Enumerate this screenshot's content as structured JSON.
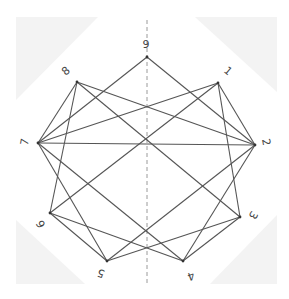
{
  "diagram": {
    "type": "graph",
    "nodes": [
      {
        "id": "1",
        "label": "1",
        "x": 218,
        "y": 83,
        "lx": 228,
        "ly": 71,
        "rot": 40
      },
      {
        "id": "2",
        "label": "2",
        "x": 255,
        "y": 145,
        "lx": 266,
        "ly": 142,
        "rot": 80
      },
      {
        "id": "3",
        "label": "3",
        "x": 240,
        "y": 217,
        "lx": 253,
        "ly": 215,
        "rot": 120
      },
      {
        "id": "4",
        "label": "4",
        "x": 183,
        "y": 261,
        "lx": 191,
        "ly": 276,
        "rot": 160
      },
      {
        "id": "5",
        "label": "5",
        "x": 107,
        "y": 261,
        "lx": 101,
        "ly": 273,
        "rot": 200
      },
      {
        "id": "6",
        "label": "6",
        "x": 50,
        "y": 213,
        "lx": 41,
        "ly": 224,
        "rot": 240
      },
      {
        "id": "7",
        "label": "7",
        "x": 38,
        "y": 143,
        "lx": 25,
        "ly": 142,
        "rot": 280
      },
      {
        "id": "8",
        "label": "8",
        "x": 77,
        "y": 82,
        "lx": 66,
        "ly": 71,
        "rot": 320
      },
      {
        "id": "9",
        "label": "9",
        "x": 147,
        "y": 57,
        "lx": 146,
        "ly": 44,
        "rot": 0
      }
    ],
    "edges": [
      [
        "9",
        "7"
      ],
      [
        "9",
        "2"
      ],
      [
        "8",
        "7"
      ],
      [
        "8",
        "6"
      ],
      [
        "8",
        "2"
      ],
      [
        "8",
        "3"
      ],
      [
        "1",
        "7"
      ],
      [
        "1",
        "6"
      ],
      [
        "1",
        "2"
      ],
      [
        "1",
        "3"
      ],
      [
        "7",
        "2"
      ],
      [
        "7",
        "5"
      ],
      [
        "7",
        "4"
      ],
      [
        "6",
        "5"
      ],
      [
        "6",
        "4"
      ],
      [
        "5",
        "2"
      ],
      [
        "5",
        "3"
      ],
      [
        "4",
        "2"
      ],
      [
        "4",
        "3"
      ]
    ],
    "symmetry_axis": {
      "x": 147,
      "y1": 20,
      "y2": 285,
      "style": "dashed"
    }
  }
}
